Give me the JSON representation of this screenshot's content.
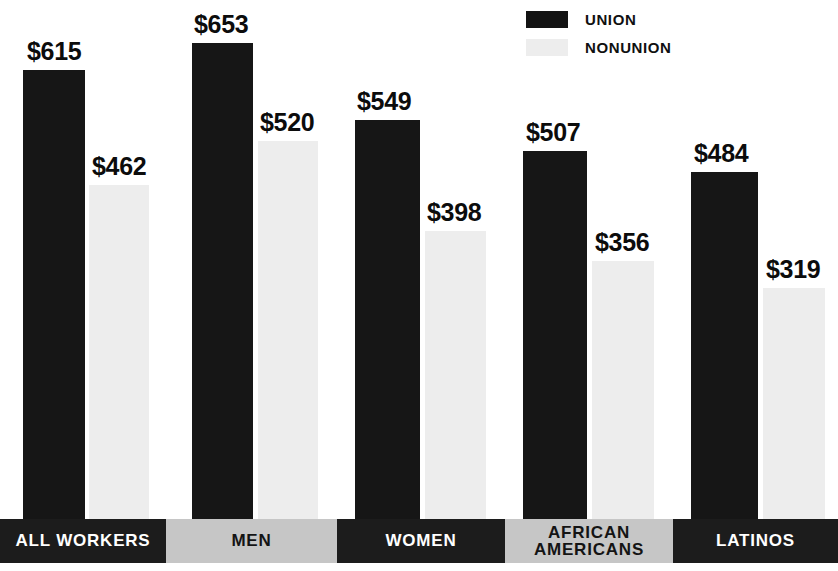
{
  "legend": {
    "items": [
      {
        "label": "UNION",
        "swatch": "#131313",
        "key": "union"
      },
      {
        "label": "NONUNION",
        "swatch": "#ededed",
        "key": "nonunion"
      }
    ]
  },
  "chart_data": {
    "type": "bar",
    "title": "",
    "xlabel": "",
    "ylabel": "",
    "grid": false,
    "legend_position": "top-right",
    "categories": [
      "ALL WORKERS",
      "MEN",
      "WOMEN",
      "AFRICAN AMERICANS",
      "LATINOS"
    ],
    "series": [
      {
        "name": "UNION",
        "color": "#161616",
        "values": [
          615,
          653,
          549,
          507,
          484
        ]
      },
      {
        "name": "NONUNION",
        "color": "#ededed",
        "values": [
          462,
          520,
          398,
          356,
          319
        ]
      }
    ],
    "value_labels": {
      "UNION": [
        "$615",
        "$653",
        "$549",
        "$507",
        "$484"
      ],
      "NONUNION": [
        "$462",
        "$520",
        "$398",
        "$356",
        "$319"
      ]
    },
    "ylim": [
      0,
      710
    ]
  },
  "bars": [
    {
      "name": "all-workers-union",
      "value_label": "$615",
      "series": "union",
      "left": 23,
      "width": 62,
      "height": 449,
      "label_left": 27,
      "label_bottom": 455
    },
    {
      "name": "all-workers-nonunion",
      "value_label": "$462",
      "series": "nonunion",
      "left": 89,
      "width": 60,
      "height": 334,
      "label_left": 92,
      "label_bottom": 340
    },
    {
      "name": "men-union",
      "value_label": "$653",
      "series": "union",
      "left": 192,
      "width": 61,
      "height": 476,
      "label_left": 194,
      "label_bottom": 482
    },
    {
      "name": "men-nonunion",
      "value_label": "$520",
      "series": "nonunion",
      "left": 258,
      "width": 60,
      "height": 378,
      "label_left": 260,
      "label_bottom": 384
    },
    {
      "name": "women-union",
      "value_label": "$549",
      "series": "union",
      "left": 355,
      "width": 65,
      "height": 399,
      "label_left": 357,
      "label_bottom": 405
    },
    {
      "name": "women-nonunion",
      "value_label": "$398",
      "series": "nonunion",
      "left": 425,
      "width": 61,
      "height": 288,
      "label_left": 427,
      "label_bottom": 294
    },
    {
      "name": "african-americans-union",
      "value_label": "$507",
      "series": "union",
      "left": 523,
      "width": 64,
      "height": 368,
      "label_left": 526,
      "label_bottom": 374
    },
    {
      "name": "african-americans-nonunion",
      "value_label": "$356",
      "series": "nonunion",
      "left": 592,
      "width": 62,
      "height": 258,
      "label_left": 595,
      "label_bottom": 264
    },
    {
      "name": "latinos-union",
      "value_label": "$484",
      "series": "union",
      "left": 691,
      "width": 67,
      "height": 347,
      "label_left": 694,
      "label_bottom": 353
    },
    {
      "name": "latinos-nonunion",
      "value_label": "$319",
      "series": "nonunion",
      "left": 763,
      "width": 62,
      "height": 231,
      "label_left": 766,
      "label_bottom": 237
    }
  ],
  "label_band": [
    {
      "text": "ALL WORKERS",
      "tone": "dark",
      "left": 0,
      "width": 166
    },
    {
      "text": "MEN",
      "tone": "gray",
      "left": 166,
      "width": 171
    },
    {
      "text": "WOMEN",
      "tone": "dark",
      "left": 337,
      "width": 168
    },
    {
      "text": "AFRICAN AMERICANS",
      "tone": "gray",
      "left": 505,
      "width": 168
    },
    {
      "text": "LATINOS",
      "tone": "dark",
      "left": 673,
      "width": 165
    }
  ]
}
